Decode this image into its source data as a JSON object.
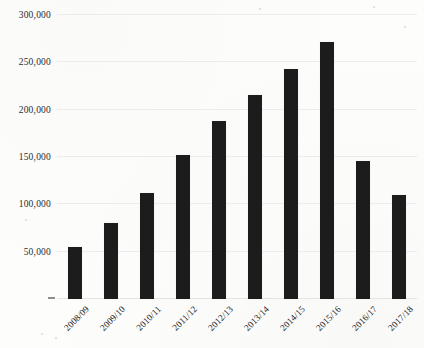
{
  "chart_data": {
    "type": "bar",
    "title": "",
    "subtitle": "",
    "xlabel": "",
    "ylabel": "",
    "categories": [
      "2008/09",
      "2009/10",
      "2010/11",
      "2011/12",
      "2012/13",
      "2013/14",
      "2014/15",
      "2015/16",
      "2016/17",
      "2017/18"
    ],
    "values": [
      55000,
      80000,
      112000,
      152000,
      188000,
      216000,
      243000,
      272000,
      146000,
      110000
    ],
    "ylim": [
      0,
      300000
    ],
    "ytick_values": [
      50000,
      100000,
      150000,
      200000,
      250000,
      300000
    ],
    "ytick_labels": [
      "50,000",
      "100,000",
      "150,000",
      "200,000",
      "250,000",
      "300,000"
    ],
    "grid": true,
    "legend": null,
    "legend_position": "none",
    "bar_color": "#1c1c1c",
    "gridline_color": "#ececec",
    "background_color": "#fdfdfc",
    "xtick_label_rotation": -45
  }
}
